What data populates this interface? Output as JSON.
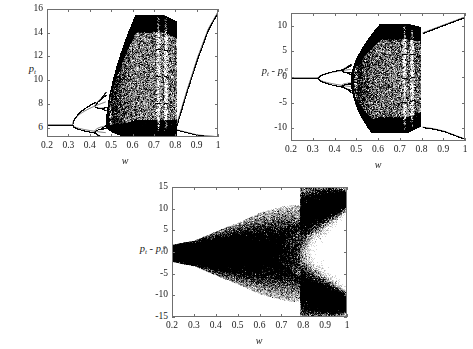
{
  "figure": {
    "background_color": "#ffffff",
    "axis_color": "#6f6f6f",
    "data_color": "#000000",
    "width": 473,
    "height": 349
  },
  "chart_data": [
    {
      "id": "panel-a",
      "type": "scatter",
      "subtype": "bifurcation-diagram",
      "title": "",
      "xlabel": "w",
      "ylabel": "p_t",
      "ylabel_display": "pₜ",
      "xlim": [
        0.2,
        1.0
      ],
      "ylim": [
        5.2,
        16.0
      ],
      "xticks": [
        0.2,
        0.3,
        0.4,
        0.5,
        0.6,
        0.7,
        0.8,
        0.9,
        1
      ],
      "xtick_labels": [
        "0.2",
        "0.3",
        "0.4",
        "0.5",
        "0.6",
        "0.7",
        "0.8",
        "0.9",
        "1"
      ],
      "yticks": [
        6,
        8,
        10,
        12,
        14,
        16
      ],
      "ytick_labels": [
        "6",
        "8",
        "10",
        "12",
        "14",
        "16"
      ],
      "grid": false,
      "legend": false,
      "description": "Deterministic bifurcation diagram of price p_t versus weight w. Fixed point at p=6.3 until first period-doubling near w=0.315, second doubling near w=0.42, cascade to chaos near w=0.47, broad chaotic band spanning p in [5.3,15.6] with periodic windows near w=0.49, 0.72, 0.75, chaos ends near w=0.80 collapsing to a stable branch rising from p=6.2 at w=0.82 to p=16 at w=1.",
      "branches": {
        "fixed_point": 6.3,
        "first_bifurcation_w": 0.315,
        "second_bifurcation_w": 0.42,
        "chaos_onset_w": 0.47,
        "chaos_end_w": 0.8,
        "periodic_windows_w": [
          0.49,
          0.715,
          0.75
        ],
        "upper_envelope_max": 15.6,
        "lower_envelope_min": 5.3,
        "post_chaos_branch": [
          [
            0.8,
            6.2
          ],
          [
            0.85,
            9.2
          ],
          [
            0.9,
            12.0
          ],
          [
            0.95,
            14.4
          ],
          [
            1.0,
            16.0
          ]
        ],
        "post_chaos_lower_branch": [
          [
            0.8,
            5.9
          ],
          [
            0.9,
            5.45
          ],
          [
            1.0,
            5.3
          ]
        ]
      }
    },
    {
      "id": "panel-b",
      "type": "scatter",
      "subtype": "bifurcation-diagram",
      "title": "",
      "xlabel": "w",
      "ylabel": "p_t - p_t^e",
      "ylabel_display": "pₜ - pₜᵉ",
      "xlim": [
        0.2,
        1.0
      ],
      "ylim": [
        -12.5,
        12.5
      ],
      "xticks": [
        0.2,
        0.3,
        0.4,
        0.5,
        0.6,
        0.7,
        0.8,
        0.9,
        1
      ],
      "xtick_labels": [
        "0.2",
        "0.3",
        "0.4",
        "0.5",
        "0.6",
        "0.7",
        "0.8",
        "0.9",
        "1"
      ],
      "yticks": [
        -10,
        -5,
        0,
        5,
        10
      ],
      "ytick_labels": [
        "-10",
        "-5",
        "0",
        "5",
        "10"
      ],
      "grid": false,
      "legend": false,
      "description": "Deterministic bifurcation diagram of forecast error p_t - p_t^e versus w. Zero fixed point until w=0.32, symmetric pitchfork splitting into +/- branches, period doubling near w=0.43, chaos from w=0.47 to w=0.79 with envelope reaching +/-10.5, periodic windows near w=0.49, 0.72, 0.75, then two smooth diverging branches reaching +/-12 at w=1.",
      "branches": {
        "fixed_point": 0,
        "first_bifurcation_w": 0.32,
        "second_bifurcation_w": 0.43,
        "chaos_onset_w": 0.47,
        "chaos_end_w": 0.79,
        "periodic_windows_w": [
          0.49,
          0.715,
          0.75
        ],
        "upper_envelope_max": 10.6,
        "lower_envelope_min": -10.6,
        "post_chaos_upper_branch": [
          [
            0.8,
            8.8
          ],
          [
            0.85,
            9.6
          ],
          [
            0.9,
            10.4
          ],
          [
            0.95,
            11.2
          ],
          [
            1.0,
            12.0
          ]
        ],
        "post_chaos_lower_branch": [
          [
            0.8,
            -9.6
          ],
          [
            0.85,
            -9.9
          ],
          [
            0.9,
            -10.4
          ],
          [
            0.95,
            -11.2
          ],
          [
            1.0,
            -12.0
          ]
        ]
      }
    },
    {
      "id": "panel-c",
      "type": "scatter",
      "subtype": "noisy-bifurcation-diagram",
      "title": "",
      "xlabel": "w",
      "ylabel": "p_t - p_t^e",
      "ylabel_display": "pₜ - pₜᵉ",
      "xlim": [
        0.2,
        1.0
      ],
      "ylim": [
        -15,
        15
      ],
      "xticks": [
        0.2,
        0.3,
        0.4,
        0.5,
        0.6,
        0.7,
        0.8,
        0.9,
        1
      ],
      "xtick_labels": [
        "0.2",
        "0.3",
        "0.4",
        "0.5",
        "0.6",
        "0.7",
        "0.8",
        "0.9",
        "1"
      ],
      "yticks": [
        -15,
        -10,
        -5,
        0,
        5,
        10,
        15
      ],
      "ytick_labels": [
        "-15",
        "-10",
        "-5",
        "0",
        "5",
        "10",
        "15"
      ],
      "grid": false,
      "legend": false,
      "description": "Stochastic bifurcation diagram of forecast error p_t - p_t^e versus w with noise. Dense cloud about zero with spread +/-2 at w=0.2 widening steadily to +/-11 by w=0.7, a narrow gap opening near w=0.75-0.80, then splitting into two dense diverging bands reaching about +12.5 and -11.5 at w=1.",
      "envelope": [
        [
          0.2,
          2.0
        ],
        [
          0.3,
          3.0
        ],
        [
          0.4,
          5.2
        ],
        [
          0.5,
          7.2
        ],
        [
          0.6,
          9.5
        ],
        [
          0.7,
          10.8
        ],
        [
          0.75,
          11.2
        ],
        [
          0.8,
          11.0
        ],
        [
          0.9,
          12.0
        ],
        [
          1.0,
          13.2
        ]
      ],
      "split_w": 0.78,
      "upper_band_at_1": 12.5,
      "lower_band_at_1": -11.5
    }
  ]
}
